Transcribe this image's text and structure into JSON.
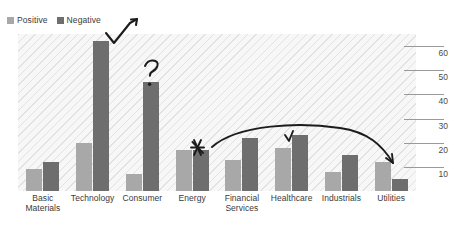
{
  "legend": {
    "items": [
      {
        "label": "Positive",
        "color": "#a8a8a8",
        "name": "legend-positive"
      },
      {
        "label": "Negative",
        "color": "#6e6e6e",
        "name": "legend-negative"
      }
    ]
  },
  "chart_data": {
    "type": "bar",
    "title": "",
    "xlabel": "",
    "ylabel": "",
    "ylim": [
      0,
      65
    ],
    "grid": true,
    "axis_position": "right",
    "legend_position": "top-left",
    "categories": [
      "Basic\nMaterials",
      "Technology",
      "Consumer",
      "Energy",
      "Financial\nServices",
      "Healthcare",
      "Industrials",
      "Utilities"
    ],
    "tick_labels": [
      "10",
      "20",
      "30",
      "40",
      "50",
      "60"
    ],
    "tick_values": [
      10,
      20,
      30,
      40,
      50,
      60
    ],
    "series": [
      {
        "name": "Positive",
        "color": "#a8a8a8",
        "values": [
          9,
          20,
          7,
          17,
          13,
          18,
          8,
          12
        ]
      },
      {
        "name": "Negative",
        "color": "#6e6e6e",
        "values": [
          12,
          62,
          45,
          17,
          22,
          23,
          15,
          5
        ]
      }
    ],
    "annotations": [
      {
        "name": "checkmark-arrow-technology",
        "kind": "hand-drawn-arrow",
        "target": "Technology"
      },
      {
        "name": "question-mark-consumer",
        "kind": "hand-drawn-question-mark",
        "target": "Consumer"
      },
      {
        "name": "star-energy",
        "kind": "hand-drawn-star",
        "target": "Energy"
      },
      {
        "name": "check-healthcare",
        "kind": "hand-drawn-check",
        "target": "Healthcare"
      },
      {
        "name": "curved-trend-arrow",
        "kind": "hand-drawn-curved-arrow",
        "target": "Energy to Utilities"
      }
    ]
  }
}
